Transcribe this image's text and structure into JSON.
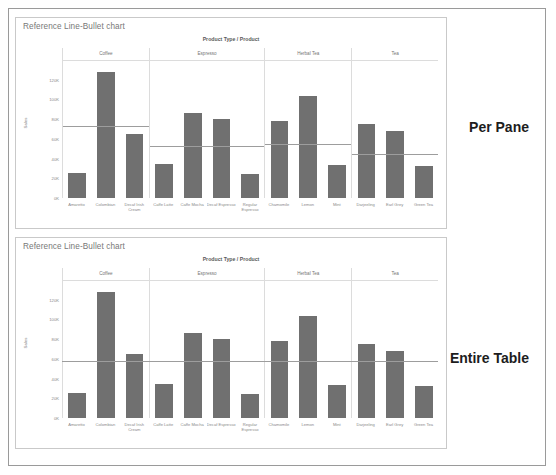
{
  "page": {
    "background": "#ffffff",
    "border_color": "#9a9a9a"
  },
  "side_labels": {
    "top": "Per Pane",
    "bottom": "Entire Table"
  },
  "charts": [
    {
      "id": "per-pane",
      "title": "Reference Line-Bullet chart",
      "column_title": "Product Type / Product",
      "y_axis_title": "Sales",
      "reference_scope": "Per Pane"
    },
    {
      "id": "entire-table",
      "title": "Reference Line-Bullet chart",
      "column_title": "Product Type / Product",
      "y_axis_title": "Sales",
      "reference_scope": "Entire Table"
    }
  ],
  "colors": {
    "bar": "#707070",
    "reference_line": "#9d9d9d",
    "grid": "#dcdcdc",
    "axis_text": "#8a8a8a",
    "title_text": "#787878"
  },
  "chart_data": [
    {
      "type": "bar",
      "title": "Reference Line-Bullet chart",
      "subtitle": "Per Pane",
      "xlabel": "Product Type / Product",
      "ylabel": "Sales",
      "ylim": [
        0,
        140000
      ],
      "yticks": [
        0,
        20000,
        40000,
        60000,
        80000,
        100000,
        120000
      ],
      "ytick_labels": [
        "0K",
        "20K",
        "40K",
        "60K",
        "80K",
        "100K",
        "120K"
      ],
      "grid": false,
      "legend": "none",
      "panes": [
        {
          "name": "Coffee",
          "categories": [
            "Amaretto",
            "Colombian",
            "Decaf Irish Cream"
          ],
          "values": [
            25000,
            128000,
            65000
          ],
          "reference_line": 73000
        },
        {
          "name": "Espresso",
          "categories": [
            "Caffe Latte",
            "Caffe Mocha",
            "Decaf Espresso",
            "Regular Espresso"
          ],
          "values": [
            35000,
            86000,
            80000,
            24000
          ],
          "reference_line": 53000
        },
        {
          "name": "Herbal Tea",
          "categories": [
            "Chamomile",
            "Lemon",
            "Mint"
          ],
          "values": [
            78000,
            103000,
            34000
          ],
          "reference_line": 55000
        },
        {
          "name": "Tea",
          "categories": [
            "Darjeeling",
            "Earl Grey",
            "Green Tea"
          ],
          "values": [
            75000,
            68000,
            32000
          ],
          "reference_line": 45000
        }
      ]
    },
    {
      "type": "bar",
      "title": "Reference Line-Bullet chart",
      "subtitle": "Entire Table",
      "xlabel": "Product Type / Product",
      "ylabel": "Sales",
      "ylim": [
        0,
        140000
      ],
      "yticks": [
        0,
        20000,
        40000,
        60000,
        80000,
        100000,
        120000
      ],
      "ytick_labels": [
        "0K",
        "20K",
        "40K",
        "60K",
        "80K",
        "100K",
        "120K"
      ],
      "grid": false,
      "legend": "none",
      "reference_line": 58000,
      "panes": [
        {
          "name": "Coffee",
          "categories": [
            "Amaretto",
            "Colombian",
            "Decaf Irish Cream"
          ],
          "values": [
            25000,
            128000,
            65000
          ]
        },
        {
          "name": "Espresso",
          "categories": [
            "Caffe Latte",
            "Caffe Mocha",
            "Decaf Espresso",
            "Regular Espresso"
          ],
          "values": [
            35000,
            86000,
            80000,
            24000
          ]
        },
        {
          "name": "Herbal Tea",
          "categories": [
            "Chamomile",
            "Lemon",
            "Mint"
          ],
          "values": [
            78000,
            103000,
            34000
          ]
        },
        {
          "name": "Tea",
          "categories": [
            "Darjeeling",
            "Earl Grey",
            "Green Tea"
          ],
          "values": [
            75000,
            68000,
            32000
          ]
        }
      ]
    }
  ]
}
